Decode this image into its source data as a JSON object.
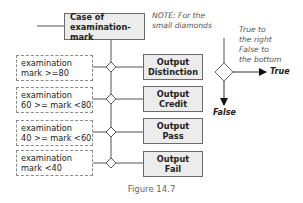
{
  "diagram": {
    "case_box": {
      "line1": "Case of",
      "line2": "examination-mark"
    },
    "conditions": [
      {
        "line1": "examination",
        "line2": "mark >=80"
      },
      {
        "line1": "examination",
        "line2": "60 >= mark <80"
      },
      {
        "line1": "examination",
        "line2": "40 >= mark <60"
      },
      {
        "line1": "examination",
        "line2": "mark <40"
      }
    ],
    "outputs": [
      {
        "line1": "Output",
        "line2": "Distinction"
      },
      {
        "line1": "Output",
        "line2": "Credit"
      },
      {
        "line1": "Output",
        "line2": "Pass"
      },
      {
        "line1": "Output",
        "line2": "Fail"
      }
    ],
    "note": {
      "line1": "NOTE: For the",
      "line2": "small diamonds"
    },
    "legend": {
      "line1": "True to",
      "line2": "the right",
      "line3": "False to",
      "line4": "the bottom",
      "true_label": "True",
      "false_label": "False"
    },
    "caption": "Figure 14.7"
  }
}
